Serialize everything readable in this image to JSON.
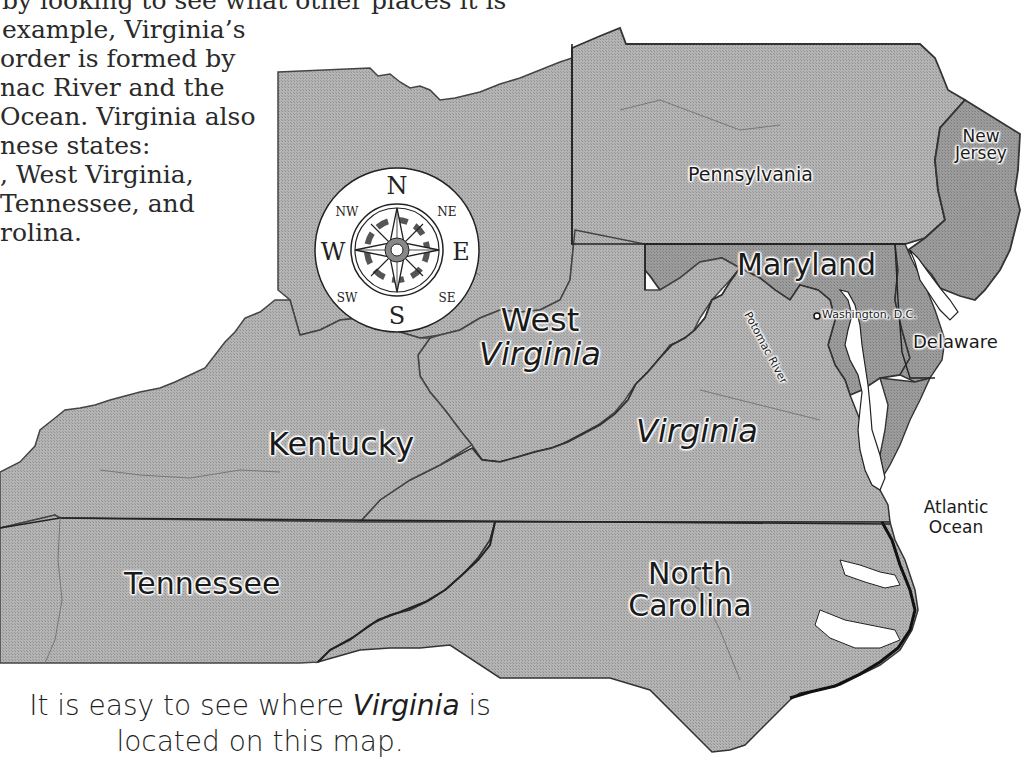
{
  "intro_text": {
    "lines": [
      "by looking to see what other places it is",
      "example, Virginia’s",
      "order is formed by",
      "nac River and the",
      "Ocean. Virginia also",
      "nese states:",
      ", West Virginia,",
      " Tennessee, and",
      "rolina."
    ]
  },
  "map": {
    "fill_color": "#a9a9a9",
    "border_color": "#333333",
    "water_color": "#ffffff",
    "states": [
      {
        "id": "ohio",
        "label": ""
      },
      {
        "id": "pennsylvania",
        "label": "Pennsylvania"
      },
      {
        "id": "new-jersey",
        "label_line1": "New",
        "label_line2": "Jersey"
      },
      {
        "id": "maryland",
        "label": "Maryland"
      },
      {
        "id": "delaware",
        "label": "Delaware"
      },
      {
        "id": "west-virginia",
        "label_line1": "West",
        "label_line2": "Virginia"
      },
      {
        "id": "virginia",
        "label": "Virginia"
      },
      {
        "id": "kentucky",
        "label": "Kentucky"
      },
      {
        "id": "tennessee",
        "label": "Tennessee"
      },
      {
        "id": "north-carolina",
        "label_line1": "North",
        "label_line2": "Carolina"
      }
    ],
    "features": {
      "potomac_river": "Potomac River",
      "washington_dc": "Washington, D.C.",
      "atlantic_line1": "Atlantic",
      "atlantic_line2": "Ocean"
    },
    "compass": {
      "n": "N",
      "s": "S",
      "e": "E",
      "w": "W",
      "ne": "NE",
      "nw": "NW",
      "se": "SE",
      "sw": "SW"
    }
  },
  "caption": {
    "line1_prefix": "It is easy to see where ",
    "line1_emph": "Virginia",
    "line1_suffix": " is",
    "line2": "located on this map."
  }
}
